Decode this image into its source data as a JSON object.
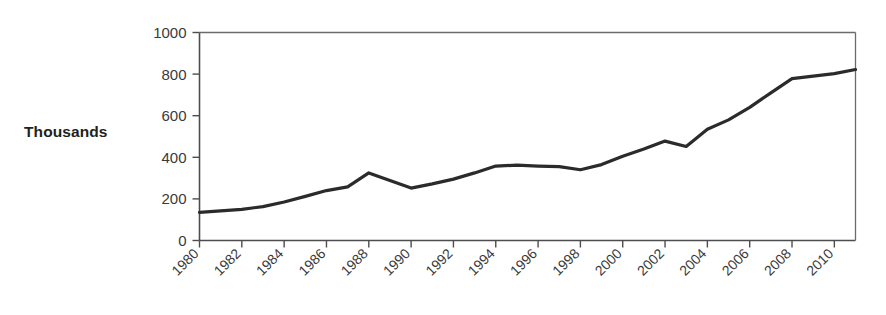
{
  "chart_data": {
    "type": "line",
    "title": "",
    "xlabel": "",
    "ylabel": "Thousands",
    "ylim": [
      0,
      1000
    ],
    "xlim": [
      1980,
      2011
    ],
    "grid": false,
    "legend": "none",
    "y_ticks": [
      0,
      200,
      400,
      600,
      800,
      1000
    ],
    "y_tick_labels": [
      "0",
      "200",
      "400",
      "600",
      "800",
      "1000"
    ],
    "x_tick_labels": [
      "1980",
      "1982",
      "1984",
      "1986",
      "1988",
      "1990",
      "1992",
      "1994",
      "1996",
      "1998",
      "2000",
      "2002",
      "2004",
      "2006",
      "2008",
      "2010"
    ],
    "x": [
      1980,
      1981,
      1982,
      1983,
      1984,
      1985,
      1986,
      1987,
      1988,
      1989,
      1990,
      1991,
      1992,
      1993,
      1994,
      1995,
      1996,
      1997,
      1998,
      1999,
      2000,
      2001,
      2002,
      2003,
      2004,
      2005,
      2006,
      2007,
      2008,
      2009,
      2010,
      2011
    ],
    "values": [
      135,
      143,
      152,
      163,
      180,
      205,
      228,
      248,
      268,
      290,
      325,
      292,
      258,
      270,
      290,
      310,
      330,
      352,
      363,
      362,
      358,
      352,
      343,
      345,
      368,
      395,
      425,
      450,
      470,
      482,
      455,
      490
    ],
    "series": [
      {
        "name": "Thousands",
        "color": "#2b2b2b",
        "points": [
          {
            "x": 1980,
            "y": 135
          },
          {
            "x": 1981,
            "y": 142
          },
          {
            "x": 1982,
            "y": 150
          },
          {
            "x": 1983,
            "y": 163
          },
          {
            "x": 1984,
            "y": 185
          },
          {
            "x": 1985,
            "y": 212
          },
          {
            "x": 1986,
            "y": 240
          },
          {
            "x": 1987,
            "y": 258
          },
          {
            "x": 1988,
            "y": 325
          },
          {
            "x": 1989,
            "y": 288
          },
          {
            "x": 1990,
            "y": 252
          },
          {
            "x": 1991,
            "y": 272
          },
          {
            "x": 1992,
            "y": 295
          },
          {
            "x": 1993,
            "y": 325
          },
          {
            "x": 1994,
            "y": 358
          },
          {
            "x": 1995,
            "y": 362
          },
          {
            "x": 1996,
            "y": 358
          },
          {
            "x": 1997,
            "y": 355
          },
          {
            "x": 1998,
            "y": 340
          },
          {
            "x": 1999,
            "y": 365
          },
          {
            "x": 2000,
            "y": 405
          },
          {
            "x": 2001,
            "y": 440
          },
          {
            "x": 2002,
            "y": 478
          },
          {
            "x": 2003,
            "y": 452
          },
          {
            "x": 2004,
            "y": 535
          },
          {
            "x": 2005,
            "y": 580
          },
          {
            "x": 2006,
            "y": 640
          },
          {
            "x": 2007,
            "y": 710
          },
          {
            "x": 2008,
            "y": 778
          },
          {
            "x": 2009,
            "y": 790
          },
          {
            "x": 2010,
            "y": 802
          },
          {
            "x": 2011,
            "y": 822
          }
        ]
      }
    ]
  },
  "axis_title": {
    "text": "Thousands"
  }
}
